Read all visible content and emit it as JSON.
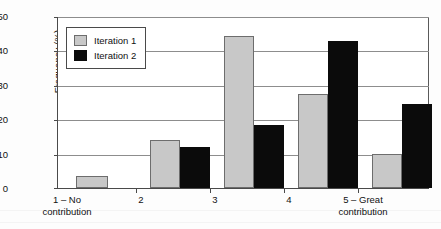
{
  "chart_data": {
    "type": "bar",
    "title": "",
    "xlabel": "",
    "ylabel": "Frequency (%)",
    "ylim": [
      0,
      50
    ],
    "ytick_values": [
      0,
      10,
      20,
      30,
      40,
      50
    ],
    "ytick_labels": [
      "0",
      "10",
      "20",
      "30",
      "40",
      "50"
    ],
    "grid": true,
    "legend_position": "upper left",
    "categories": [
      "1 – No\ncontribution",
      "2",
      "3",
      "4",
      "5 – Great\ncontribution"
    ],
    "category_labels": [
      {
        "line1": "1 – No",
        "line2": "contribution"
      },
      {
        "line1": "2",
        "line2": ""
      },
      {
        "line1": "3",
        "line2": ""
      },
      {
        "line1": "4",
        "line2": ""
      },
      {
        "line1": "5 – Great",
        "line2": "contribution"
      }
    ],
    "series": [
      {
        "name": "Iteration 1",
        "color": "#c8c8c8",
        "values": [
          3.5,
          14,
          44.5,
          27.5,
          9.8
        ]
      },
      {
        "name": "Iteration 2",
        "color": "#0b0b0b",
        "values": [
          0,
          12,
          18.5,
          43,
          24.5
        ]
      }
    ]
  },
  "legend": {
    "items": [
      {
        "label": "Iteration 1",
        "swatch": "light-gray-swatch"
      },
      {
        "label": "Iteration 2",
        "swatch": "black-swatch"
      }
    ]
  },
  "axes": {
    "y_title": "Frequency (%)",
    "y_ticks": [
      "50",
      "40",
      "30",
      "20",
      "10",
      "0"
    ]
  }
}
